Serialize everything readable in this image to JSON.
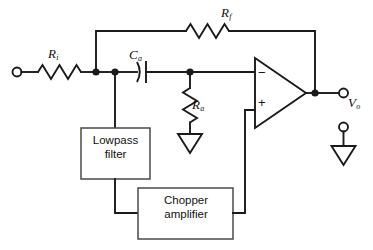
{
  "diagram": {
    "type": "circuit-schematic",
    "background_color": "#ffffff",
    "line_color": "#1a1a1a",
    "box_border_color": "#4a4a4a"
  },
  "labels": {
    "input_resistor": {
      "symbol": "R",
      "subscript": "i"
    },
    "feedback_resistor": {
      "symbol": "R",
      "subscript": "f"
    },
    "coupling_capacitor": {
      "symbol": "C",
      "subscript": "a"
    },
    "shunt_resistor": {
      "symbol": "R",
      "subscript": "a"
    },
    "output_voltage": {
      "symbol": "V",
      "subscript": "o"
    }
  },
  "blocks": {
    "lowpass_filter": {
      "line1": "Lowpass",
      "line2": "filter"
    },
    "chopper_amplifier": {
      "line1": "Chopper",
      "line2": "amplifier"
    }
  },
  "opamp": {
    "inverting_sign": "−",
    "noninverting_sign": "+"
  },
  "terminals": {
    "input_terminal": "input",
    "output_terminal": "output",
    "ground_terminal": "ground"
  }
}
